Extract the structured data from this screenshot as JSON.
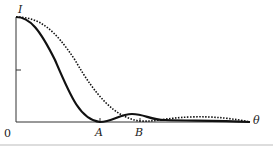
{
  "diagram": {
    "y_label": "I",
    "x_label": "θ",
    "origin_label": "0",
    "markers": [
      {
        "label": "A"
      },
      {
        "label": "B"
      }
    ],
    "series": [
      {
        "name": "solid",
        "style": "solid",
        "first_zero_at": "A"
      },
      {
        "name": "dotted",
        "style": "dotted",
        "first_zero_at": "B"
      }
    ]
  }
}
